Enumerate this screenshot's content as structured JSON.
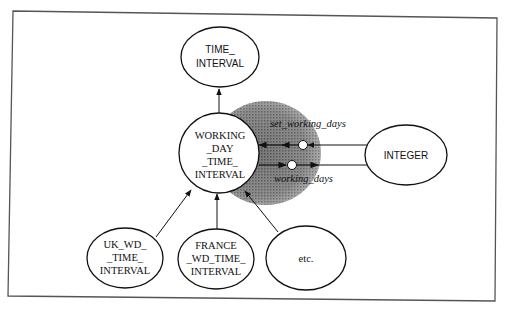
{
  "diagram": {
    "type": "class-inheritance-diagram",
    "nodes": {
      "time_interval": {
        "lines": [
          "TIME_",
          "INTERVAL"
        ]
      },
      "working_day": {
        "lines": [
          "WORKING",
          "_DAY",
          "_TIME_",
          "INTERVAL"
        ]
      },
      "integer": {
        "lines": [
          "INTEGER"
        ]
      },
      "uk": {
        "lines": [
          "UK_WD_",
          "_TIME_",
          "INTERVAL"
        ]
      },
      "france": {
        "lines": [
          "FRANCE",
          "_WD_TIME_",
          "INTERVAL"
        ]
      },
      "etc": {
        "lines": [
          "etc."
        ]
      }
    },
    "features": {
      "setter": "set_working_days",
      "getter": "working_days"
    },
    "edges": [
      {
        "from": "working_day",
        "to": "time_interval",
        "kind": "inherits"
      },
      {
        "from": "uk",
        "to": "working_day",
        "kind": "inherits"
      },
      {
        "from": "france",
        "to": "working_day",
        "kind": "inherits"
      },
      {
        "from": "etc",
        "to": "working_day",
        "kind": "inherits"
      },
      {
        "from": "integer",
        "to": "working_day",
        "via": "set_working_days"
      },
      {
        "from": "working_day",
        "to": "integer",
        "via": "working_days"
      }
    ],
    "colors": {
      "stroke": "#1a1a1a",
      "shade": "#6e6e6e",
      "frame": "#555555"
    }
  }
}
